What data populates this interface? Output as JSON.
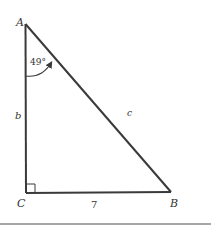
{
  "diagram": {
    "type": "right-triangle",
    "vertices": {
      "A": {
        "label": "A"
      },
      "B": {
        "label": "B"
      },
      "C": {
        "label": "C"
      }
    },
    "sides": {
      "b": {
        "label": "b"
      },
      "c": {
        "label": "c"
      },
      "a": {
        "label": "7"
      }
    },
    "angle_A": {
      "label": "49°"
    },
    "right_angle_at": "C",
    "colors": {
      "line": "#3a3a3a",
      "text": "#333333",
      "rule": "#888888"
    }
  }
}
